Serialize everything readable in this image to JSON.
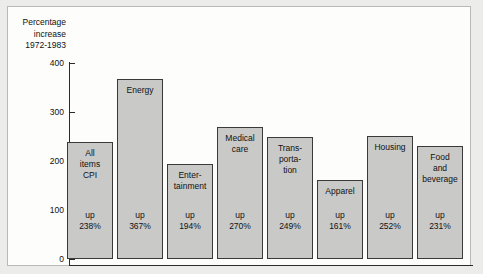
{
  "chart_data": {
    "type": "bar",
    "title": "Percentage increase 1972-1983",
    "xlabel": "",
    "ylabel": "",
    "ylim": [
      0,
      430
    ],
    "grid": false,
    "legend": null,
    "yticks": [
      "0",
      "100",
      "200",
      "300",
      "400"
    ],
    "ytick_values": [
      0,
      100,
      200,
      300,
      400
    ],
    "categories": [
      "All\nitems\nCPI",
      "Energy",
      "Enter-\ntainment",
      "Medical\ncare",
      "Trans-\nporta-\ntion",
      "Apparel",
      "Housing",
      "Food\nand\nbeverage"
    ],
    "values": [
      238,
      367,
      194,
      270,
      249,
      161,
      252,
      231
    ],
    "value_labels": [
      "up\n238%",
      "up\n367%",
      "up\n194%",
      "up\n270%",
      "up\n249%",
      "up\n161%",
      "up\n252%",
      "up\n231%"
    ],
    "bar_fill_color": "#c9c9c7",
    "bar_border_color": "#3a3a3a",
    "panel_color": "#fdfdfc",
    "background_color": "#ececeb",
    "axis_color": "#2b2b2b"
  }
}
